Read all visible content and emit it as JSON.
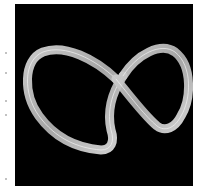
{
  "image": {
    "subject": "glowing figure-eight ribbon on black background",
    "background_color": "#000000",
    "ribbon_color": "#c8c8c8",
    "ribbon_highlight": "#eeeeee"
  },
  "icons": {
    "ribbon": "figure-eight-ribbon"
  }
}
